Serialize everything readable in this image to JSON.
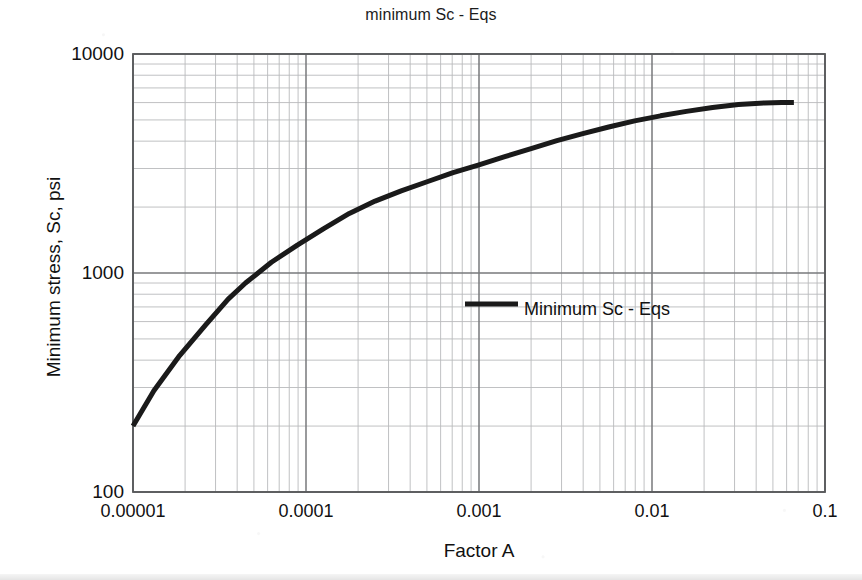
{
  "chart_data": {
    "type": "line",
    "title": "minimum Sc - Eqs",
    "xlabel": "Factor A",
    "ylabel": "Minimum stress, Sc, psi",
    "xscale": "log",
    "yscale": "log",
    "xlim": [
      1e-05,
      0.1
    ],
    "ylim": [
      100,
      10000
    ],
    "grid": true,
    "grid_minor": true,
    "legend_position": "center-right-inside",
    "xticks": [
      {
        "value": 1e-05,
        "label": "0.00001"
      },
      {
        "value": 0.0001,
        "label": "0.0001"
      },
      {
        "value": 0.001,
        "label": "0.001"
      },
      {
        "value": 0.01,
        "label": "0.01"
      },
      {
        "value": 0.1,
        "label": "0.1"
      }
    ],
    "yticks": [
      {
        "value": 10000,
        "label": "10000"
      },
      {
        "value": 1000,
        "label": "1000"
      },
      {
        "value": 100,
        "label": "100"
      }
    ],
    "series": [
      {
        "name": "Minimum Sc - Eqs",
        "color": "#1a1a1a",
        "linewidth": 5,
        "points": [
          {
            "x": 1e-05,
            "y": 200
          },
          {
            "x": 1.32e-05,
            "y": 290
          },
          {
            "x": 1.86e-05,
            "y": 420
          },
          {
            "x": 2.63e-05,
            "y": 580
          },
          {
            "x": 3.55e-05,
            "y": 760
          },
          {
            "x": 4.47e-05,
            "y": 900
          },
          {
            "x": 6.31e-05,
            "y": 1120
          },
          {
            "x": 8.91e-05,
            "y": 1340
          },
          {
            "x": 0.000126,
            "y": 1590
          },
          {
            "x": 0.000178,
            "y": 1870
          },
          {
            "x": 0.000251,
            "y": 2130
          },
          {
            "x": 0.000355,
            "y": 2370
          },
          {
            "x": 0.000501,
            "y": 2610
          },
          {
            "x": 0.000708,
            "y": 2870
          },
          {
            "x": 0.001,
            "y": 3120
          },
          {
            "x": 0.00141,
            "y": 3400
          },
          {
            "x": 0.002,
            "y": 3700
          },
          {
            "x": 0.00282,
            "y": 4020
          },
          {
            "x": 0.00398,
            "y": 4330
          },
          {
            "x": 0.00562,
            "y": 4640
          },
          {
            "x": 0.00794,
            "y": 4950
          },
          {
            "x": 0.0112,
            "y": 5220
          },
          {
            "x": 0.0158,
            "y": 5470
          },
          {
            "x": 0.0224,
            "y": 5700
          },
          {
            "x": 0.0316,
            "y": 5880
          },
          {
            "x": 0.0447,
            "y": 5980
          },
          {
            "x": 0.0562,
            "y": 6000
          },
          {
            "x": 0.0661,
            "y": 6000
          }
        ]
      }
    ],
    "legend": [
      {
        "label": "Minimum Sc - Eqs",
        "color": "#1a1a1a"
      }
    ]
  },
  "style": {
    "plot_bg": "#ffffff",
    "page_bg": "#ffffff",
    "axis_color": "#58595b",
    "major_grid_color": "#77787b",
    "minor_grid_color": "#b9babc",
    "text_color": "#111111"
  }
}
